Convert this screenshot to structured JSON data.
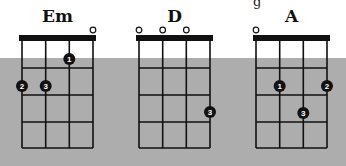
{
  "colors": {
    "background": "#ffffff",
    "band": "#adadad",
    "grid": "#111111",
    "dot": "#111111",
    "dot_text": "#ffffff"
  },
  "fragment_text": "g",
  "chords": [
    {
      "name": "Em",
      "open_strings": [
        4
      ],
      "fingers": [
        {
          "string": 3,
          "fret": 1,
          "finger": "1"
        },
        {
          "string": 1,
          "fret": 2,
          "finger": "2"
        },
        {
          "string": 2,
          "fret": 2,
          "finger": "3"
        }
      ]
    },
    {
      "name": "D",
      "open_strings": [
        1,
        2,
        3
      ],
      "fingers": [
        {
          "string": 4,
          "fret": 3,
          "finger": "3"
        }
      ]
    },
    {
      "name": "A",
      "open_strings": [
        1
      ],
      "fingers": [
        {
          "string": 2,
          "fret": 2,
          "finger": "1"
        },
        {
          "string": 4,
          "fret": 2,
          "finger": "2"
        },
        {
          "string": 3,
          "fret": 3,
          "finger": "3"
        }
      ]
    }
  ]
}
